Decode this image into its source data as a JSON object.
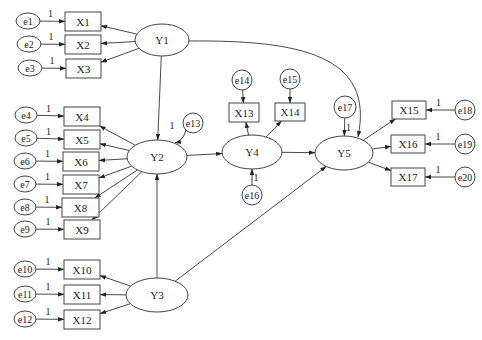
{
  "diagram": {
    "type": "structural-equation-model",
    "latent": [
      {
        "id": "Y1",
        "label": "Y1",
        "cx": 162,
        "cy": 40,
        "rx": 27,
        "ry": 16
      },
      {
        "id": "Y2",
        "label": "Y2",
        "cx": 157,
        "cy": 157,
        "rx": 30,
        "ry": 17
      },
      {
        "id": "Y3",
        "label": "Y3",
        "cx": 157,
        "cy": 295,
        "rx": 31,
        "ry": 17
      },
      {
        "id": "Y4",
        "label": "Y4",
        "cx": 252,
        "cy": 152,
        "rx": 30,
        "ry": 17
      },
      {
        "id": "Y5",
        "label": "Y5",
        "cx": 344,
        "cy": 153,
        "rx": 29,
        "ry": 17
      }
    ],
    "observed": [
      {
        "id": "X1",
        "label": "X1",
        "x": 65,
        "y": 12,
        "w": 36,
        "h": 19
      },
      {
        "id": "X2",
        "label": "X2",
        "x": 65,
        "y": 35,
        "w": 36,
        "h": 19
      },
      {
        "id": "X3",
        "label": "X3",
        "x": 66,
        "y": 59,
        "w": 35,
        "h": 19
      },
      {
        "id": "X4",
        "label": "X4",
        "x": 64,
        "y": 107,
        "w": 36,
        "h": 19
      },
      {
        "id": "X5",
        "label": "X5",
        "x": 64,
        "y": 130,
        "w": 36,
        "h": 19
      },
      {
        "id": "X6",
        "label": "X6",
        "x": 63,
        "y": 152,
        "w": 36,
        "h": 19
      },
      {
        "id": "X7",
        "label": "X7",
        "x": 63,
        "y": 175,
        "w": 36,
        "h": 19
      },
      {
        "id": "X8",
        "label": "X8",
        "x": 62,
        "y": 198,
        "w": 37,
        "h": 19
      },
      {
        "id": "X9",
        "label": "X9",
        "x": 64,
        "y": 220,
        "w": 36,
        "h": 19
      },
      {
        "id": "X10",
        "label": "X10",
        "x": 64,
        "y": 260,
        "w": 36,
        "h": 19
      },
      {
        "id": "X11",
        "label": "X11",
        "x": 64,
        "y": 285,
        "w": 36,
        "h": 19
      },
      {
        "id": "X12",
        "label": "X12",
        "x": 64,
        "y": 310,
        "w": 36,
        "h": 19
      },
      {
        "id": "X13",
        "label": "X13",
        "x": 229,
        "y": 103,
        "w": 30,
        "h": 19
      },
      {
        "id": "X14",
        "label": "X14",
        "x": 275,
        "y": 103,
        "w": 30,
        "h": 18
      },
      {
        "id": "X15",
        "label": "X15",
        "x": 392,
        "y": 101,
        "w": 34,
        "h": 18
      },
      {
        "id": "X16",
        "label": "X16",
        "x": 391,
        "y": 135,
        "w": 34,
        "h": 18
      },
      {
        "id": "X17",
        "label": "X17",
        "x": 391,
        "y": 168,
        "w": 34,
        "h": 18
      }
    ],
    "errors": [
      {
        "id": "e1",
        "label": "e1",
        "cx": 28,
        "cy": 21,
        "rx": 12,
        "ry": 8,
        "coef": "1"
      },
      {
        "id": "e2",
        "label": "e2",
        "cx": 29,
        "cy": 44,
        "rx": 12,
        "ry": 8,
        "coef": "1"
      },
      {
        "id": "e3",
        "label": "e3",
        "cx": 30,
        "cy": 68,
        "rx": 12,
        "ry": 8,
        "coef": "1"
      },
      {
        "id": "e4",
        "label": "e4",
        "cx": 26,
        "cy": 115,
        "rx": 11,
        "ry": 8,
        "coef": "1"
      },
      {
        "id": "e5",
        "label": "e5",
        "cx": 26,
        "cy": 138,
        "rx": 11,
        "ry": 8,
        "coef": "1"
      },
      {
        "id": "e6",
        "label": "e6",
        "cx": 25,
        "cy": 161,
        "rx": 11,
        "ry": 8,
        "coef": "1"
      },
      {
        "id": "e7",
        "label": "e7",
        "cx": 25,
        "cy": 184,
        "rx": 11,
        "ry": 8,
        "coef": "1"
      },
      {
        "id": "e8",
        "label": "e8",
        "cx": 25,
        "cy": 207,
        "rx": 11,
        "ry": 8,
        "coef": "1"
      },
      {
        "id": "e9",
        "label": "e9",
        "cx": 25,
        "cy": 229,
        "rx": 11,
        "ry": 8,
        "coef": "1"
      },
      {
        "id": "e10",
        "label": "e10",
        "cx": 25,
        "cy": 269,
        "rx": 11,
        "ry": 8,
        "coef": "1"
      },
      {
        "id": "e11",
        "label": "e11",
        "cx": 25,
        "cy": 294,
        "rx": 11,
        "ry": 8,
        "coef": "1"
      },
      {
        "id": "e12",
        "label": "e12",
        "cx": 25,
        "cy": 319,
        "rx": 11,
        "ry": 8,
        "coef": "1"
      },
      {
        "id": "e13",
        "label": "e13",
        "cx": 193,
        "cy": 123,
        "rx": 10,
        "ry": 10,
        "coef": "1"
      },
      {
        "id": "e14",
        "label": "e14",
        "cx": 242,
        "cy": 80,
        "rx": 10,
        "ry": 10,
        "coef": ""
      },
      {
        "id": "e15",
        "label": "e15",
        "cx": 290,
        "cy": 79,
        "rx": 10,
        "ry": 10,
        "coef": ""
      },
      {
        "id": "e16",
        "label": "e16",
        "cx": 252,
        "cy": 195,
        "rx": 10,
        "ry": 10,
        "coef": "1"
      },
      {
        "id": "e17",
        "label": "e17",
        "cx": 345,
        "cy": 107,
        "rx": 11,
        "ry": 11,
        "coef": "1"
      },
      {
        "id": "e18",
        "label": "e18",
        "cx": 465,
        "cy": 110,
        "rx": 10,
        "ry": 10,
        "coef": "1"
      },
      {
        "id": "e19",
        "label": "e19",
        "cx": 465,
        "cy": 144,
        "rx": 10,
        "ry": 10,
        "coef": "1"
      },
      {
        "id": "e20",
        "label": "e20",
        "cx": 465,
        "cy": 177,
        "rx": 10,
        "ry": 10,
        "coef": "1"
      }
    ],
    "paths": [
      {
        "from": "Y1",
        "to": "Y2",
        "kind": "structural"
      },
      {
        "from": "Y3",
        "to": "Y2",
        "kind": "structural"
      },
      {
        "from": "Y2",
        "to": "Y4",
        "kind": "structural"
      },
      {
        "from": "Y4",
        "to": "Y5",
        "kind": "structural"
      },
      {
        "from": "Y3",
        "to": "Y5",
        "kind": "structural"
      },
      {
        "from": "Y1",
        "to": "Y5",
        "kind": "structural-curved"
      }
    ],
    "measurement": [
      {
        "latent": "Y1",
        "indicators": [
          "X1",
          "X2",
          "X3"
        ]
      },
      {
        "latent": "Y2",
        "indicators": [
          "X4",
          "X5",
          "X6",
          "X7",
          "X8",
          "X9"
        ]
      },
      {
        "latent": "Y3",
        "indicators": [
          "X10",
          "X11",
          "X12"
        ]
      },
      {
        "latent": "Y4",
        "indicators": [
          "X13",
          "X14"
        ]
      },
      {
        "latent": "Y5",
        "indicators": [
          "X15",
          "X16",
          "X17"
        ]
      }
    ]
  }
}
